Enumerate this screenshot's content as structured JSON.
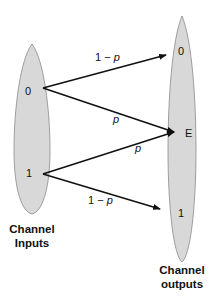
{
  "diagram": {
    "inputs": {
      "caption_line1": "Channel",
      "caption_line2": "Inputs",
      "symbols": [
        "0",
        "1"
      ]
    },
    "outputs": {
      "caption_line1": "Channel",
      "caption_line2": "outputs",
      "symbols": [
        "0",
        "E",
        "1"
      ]
    },
    "edges": [
      {
        "from": "0",
        "to": "0",
        "label": "1 − p"
      },
      {
        "from": "0",
        "to": "E",
        "label": "p"
      },
      {
        "from": "1",
        "to": "E",
        "label": "p"
      },
      {
        "from": "1",
        "to": "1",
        "label": "1 − p"
      }
    ],
    "colors": {
      "ellipse_fill": "#d8d8d8",
      "ellipse_stroke": "#8a8a8a",
      "arrow": "#111111"
    }
  }
}
